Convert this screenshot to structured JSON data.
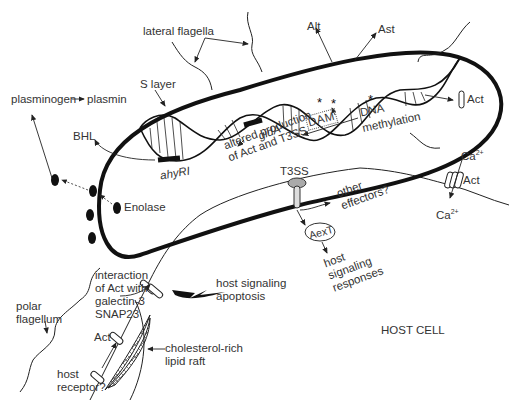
{
  "diagram": {
    "colors": {
      "line": "#111111",
      "text": "#333333",
      "background": "#ffffff"
    },
    "labels": {
      "lateral_flagella": "lateral flagella",
      "s_layer": "S layer",
      "plasminogen": "plasminogen",
      "plasmin": "plasmin",
      "bhl": "BHL",
      "ahyri": "ahyRI",
      "enolase": "Enolase",
      "gida": "gidA",
      "altered_1": "altered production",
      "altered_2": "of Act and T3SS",
      "dam": "DAM",
      "dna": "DNA",
      "methylation": "methylation",
      "alt": "Alt",
      "ast": "Ast",
      "act_secreted": "Act",
      "ca_top": "Ca",
      "ca_sup": "2+",
      "act_pore": "Act",
      "ca_bottom": "Ca",
      "t3ss": "T3SS",
      "other": "other",
      "effectors": "effectors?",
      "aext": "AexT",
      "host_resp_1": "host",
      "host_resp_2": "signaling",
      "host_resp_3": "responses",
      "interaction_1": "interaction",
      "interaction_2": "of Act with",
      "interaction_3": "galectin-3",
      "interaction_4": "SNAP23",
      "host_sig_1": "host signaling",
      "host_sig_2": "apoptosis",
      "polar_1": "polar",
      "polar_2": "flagellum",
      "act_raft": "Act",
      "chol_1": "cholesterol-rich",
      "chol_2": "lipid raft",
      "host_rec_1": "host",
      "host_rec_2": "receptor?",
      "host_cell": "HOST CELL"
    }
  }
}
